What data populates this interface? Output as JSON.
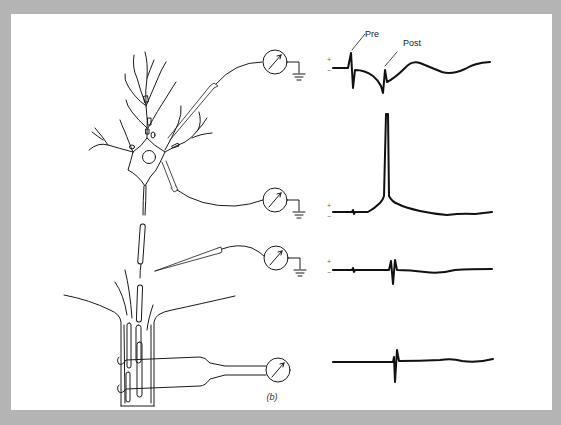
{
  "figure": {
    "caption": "(b)",
    "background_color": "#b4b4b4",
    "panel_color": "#ffffff",
    "line_color": "#1a1a1a"
  },
  "annotations": {
    "pre_label": "Pre",
    "post_label": "Post"
  },
  "recordings": [
    {
      "id": "dendrite-extracellular",
      "electrode": "pipette near dendrite",
      "meter_icon": "galvanometer-icon",
      "ground_icon": "ground-icon",
      "polarity_plus": "+",
      "polarity_minus": "−",
      "waveform": "presynaptic spike followed by postsynaptic potential"
    },
    {
      "id": "soma-intracellular",
      "electrode": "pipette in soma",
      "meter_icon": "galvanometer-icon",
      "ground_icon": "ground-icon",
      "polarity_plus": "+",
      "polarity_minus": "−",
      "waveform": "large action potential"
    },
    {
      "id": "axon-extracellular",
      "electrode": "pipette near axon",
      "meter_icon": "galvanometer-icon",
      "ground_icon": "ground-icon",
      "polarity_plus": "+",
      "polarity_minus": "−",
      "waveform": "biphasic spike"
    },
    {
      "id": "nerve-bundle-hook",
      "electrode": "hook electrodes on nerve bundle",
      "meter_icon": "galvanometer-icon",
      "waveform": "compound biphasic spike"
    }
  ]
}
